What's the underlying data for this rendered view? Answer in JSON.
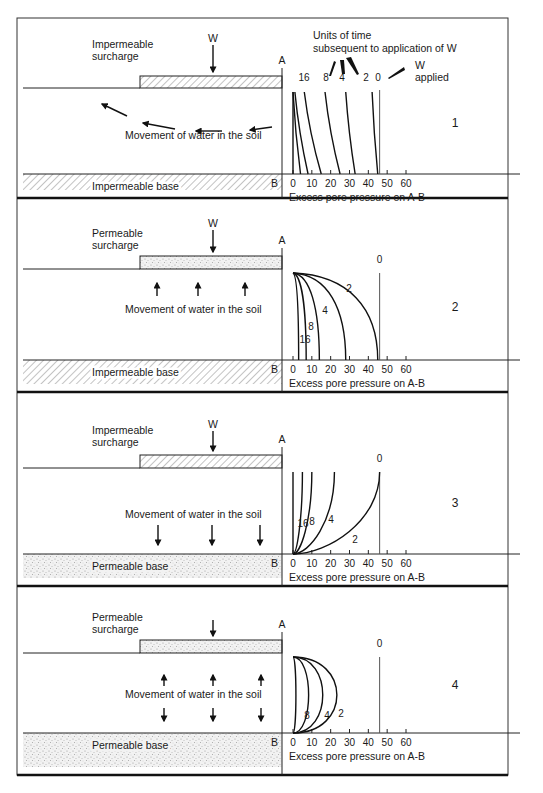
{
  "figure": {
    "legend_text_line1": "Units of time",
    "legend_text_line2": "subsequent to application of W",
    "w_applied_line1": "W",
    "w_applied_line2": "applied",
    "axis_top_label": "A",
    "axis_bottom_label": "B",
    "xaxis_label": "Excess pore pressure on A-B",
    "load_label": "W",
    "movement_label": "Movement of water in the soil"
  },
  "panels": [
    {
      "number": "1",
      "surcharge_line1": "Impermeable",
      "surcharge_line2": "surcharge",
      "surcharge_type": "impermeable",
      "base_label": "Impermeable base",
      "base_type": "impermeable",
      "show_load_label": true,
      "flow": "horizontal-outward"
    },
    {
      "number": "2",
      "surcharge_line1": "Permeable",
      "surcharge_line2": "surcharge",
      "surcharge_type": "permeable",
      "base_label": "Impermeable base",
      "base_type": "impermeable",
      "show_load_label": true,
      "flow": "upward"
    },
    {
      "number": "3",
      "surcharge_line1": "Impermeable",
      "surcharge_line2": "surcharge",
      "surcharge_type": "impermeable",
      "base_label": "Permeable base",
      "base_type": "permeable",
      "show_load_label": true,
      "flow": "downward"
    },
    {
      "number": "4",
      "surcharge_line1": "Permeable",
      "surcharge_line2": "surcharge",
      "surcharge_type": "permeable",
      "base_label": "Permeable base",
      "base_type": "permeable",
      "show_load_label": false,
      "flow": "up-and-down"
    }
  ],
  "chart_data": [
    {
      "type": "line",
      "title": "1",
      "xlabel": "Excess pore pressure on A-B",
      "ylabel": "Depth A-B",
      "xticks": [
        0,
        10,
        20,
        30,
        40,
        50,
        60
      ],
      "xlim": [
        0,
        60
      ],
      "note": "Units of time subsequent to application of W",
      "series": [
        {
          "name": "0",
          "label": "0",
          "top": 46,
          "bottom": 46
        },
        {
          "name": "2",
          "label": "2",
          "top": 42,
          "bottom": 45
        },
        {
          "name": "4",
          "label": "4",
          "top": 28,
          "bottom": 33
        },
        {
          "name": "8",
          "label": "8",
          "top": 17,
          "bottom": 25
        },
        {
          "name": "16",
          "label": "16",
          "top": 6,
          "bottom": 15
        },
        {
          "name": "32",
          "label": "",
          "top": 1,
          "bottom": 8
        },
        {
          "name": "64",
          "label": "",
          "top": 0,
          "bottom": 4
        },
        {
          "name": "inf",
          "label": "",
          "top": 0,
          "bottom": 0
        }
      ]
    },
    {
      "type": "line",
      "title": "2",
      "xlabel": "Excess pore pressure on A-B",
      "xticks": [
        0,
        10,
        20,
        30,
        40,
        50,
        60
      ],
      "xlim": [
        0,
        60
      ],
      "series": [
        {
          "name": "0",
          "label": "0",
          "top": 46,
          "bottom": 46
        },
        {
          "name": "2",
          "label": "2",
          "top": 0,
          "bottom": 45
        },
        {
          "name": "4",
          "label": "4",
          "top": 0,
          "bottom": 28
        },
        {
          "name": "8",
          "label": "8",
          "top": 0,
          "bottom": 14
        },
        {
          "name": "16",
          "label": "16",
          "top": 0,
          "bottom": 7
        },
        {
          "name": "32",
          "label": "",
          "top": 0,
          "bottom": 3
        }
      ]
    },
    {
      "type": "line",
      "title": "3",
      "xlabel": "Excess pore pressure on A-B",
      "xticks": [
        0,
        10,
        20,
        30,
        40,
        50,
        60
      ],
      "xlim": [
        0,
        60
      ],
      "series": [
        {
          "name": "0",
          "label": "0",
          "top": 46,
          "bottom": 46
        },
        {
          "name": "2",
          "label": "2",
          "top": 46,
          "bottom": 0
        },
        {
          "name": "4",
          "label": "4",
          "top": 22,
          "bottom": 0
        },
        {
          "name": "8",
          "label": "8",
          "top": 10,
          "bottom": 0
        },
        {
          "name": "16",
          "label": "16",
          "top": 5,
          "bottom": 0
        },
        {
          "name": "32",
          "label": "",
          "top": 0,
          "bottom": 0
        }
      ]
    },
    {
      "type": "line",
      "title": "4",
      "xlabel": "Excess pore pressure on A-B",
      "xticks": [
        0,
        10,
        20,
        30,
        40,
        50,
        60
      ],
      "xlim": [
        0,
        60
      ],
      "series": [
        {
          "name": "0",
          "label": "0",
          "top": 46,
          "bottom": 46
        },
        {
          "name": "2",
          "label": "2",
          "mid": 30,
          "top": 0,
          "bottom": 0
        },
        {
          "name": "4",
          "label": "4",
          "mid": 20,
          "top": 0,
          "bottom": 0
        },
        {
          "name": "8",
          "label": "8",
          "mid": 10,
          "top": 0,
          "bottom": 0
        },
        {
          "name": "16",
          "label": "",
          "mid": 1,
          "top": 0,
          "bottom": 0
        }
      ]
    }
  ]
}
